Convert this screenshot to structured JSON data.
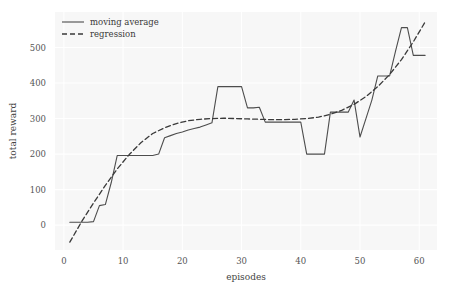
{
  "chart_data": {
    "type": "line",
    "title": "",
    "xlabel": "episodes",
    "ylabel": "total reward",
    "xlim": [
      -1.5,
      63
    ],
    "ylim": [
      -70,
      600
    ],
    "xticks": [
      0,
      10,
      20,
      30,
      40,
      50,
      60
    ],
    "xtick_labels": [
      "0",
      "10",
      "20",
      "30",
      "40",
      "50",
      "60"
    ],
    "yticks": [
      0,
      100,
      200,
      300,
      400,
      500
    ],
    "ytick_labels": [
      "0",
      "100",
      "200",
      "300",
      "400",
      "500"
    ],
    "grid": true,
    "grid_color": "#ffffff",
    "plot_bg": "#f7f7f7",
    "fig_bg": "#ffffff",
    "legend_position": "upper left",
    "series": [
      {
        "name": "moving average",
        "style": "solid",
        "color": "#4d4d4d",
        "linewidth": 1.1,
        "x": [
          1,
          2,
          3,
          4,
          5,
          6,
          7,
          8,
          9,
          10,
          11,
          12,
          13,
          14,
          15,
          16,
          17,
          18,
          19,
          20,
          21,
          22,
          23,
          24,
          25,
          26,
          27,
          28,
          29,
          30,
          31,
          32,
          33,
          34,
          35,
          36,
          37,
          38,
          39,
          40,
          41,
          42,
          43,
          44,
          45,
          46,
          47,
          48,
          49,
          50,
          51,
          52,
          53,
          54,
          55,
          56,
          57,
          58,
          59,
          60,
          61
        ],
        "values": [
          8,
          8,
          8,
          8,
          10,
          55,
          58,
          120,
          196,
          196,
          196,
          196,
          196,
          196,
          196,
          200,
          246,
          252,
          258,
          262,
          268,
          272,
          276,
          282,
          288,
          390,
          390,
          390,
          390,
          390,
          330,
          330,
          332,
          290,
          290,
          290,
          290,
          290,
          290,
          290,
          200,
          200,
          200,
          200,
          318,
          318,
          318,
          318,
          352,
          248,
          300,
          352,
          420,
          420,
          420,
          490,
          556,
          556,
          478,
          478,
          478
        ]
      },
      {
        "name": "regression",
        "style": "dashed",
        "color": "#3a3a3a",
        "linewidth": 1.3,
        "x": [
          1,
          3,
          5,
          7,
          9,
          11,
          13,
          15,
          17,
          19,
          21,
          23,
          25,
          27,
          29,
          31,
          33,
          35,
          37,
          39,
          41,
          43,
          45,
          47,
          49,
          51,
          53,
          55,
          57,
          59,
          61
        ],
        "values": [
          -48,
          10,
          62,
          112,
          158,
          198,
          232,
          258,
          274,
          286,
          294,
          298,
          300,
          301,
          300,
          299,
          298,
          297,
          297,
          298,
          300,
          304,
          312,
          324,
          340,
          362,
          390,
          424,
          466,
          516,
          572
        ]
      }
    ]
  },
  "legend": {
    "entries": [
      {
        "label": "moving average",
        "style": "solid"
      },
      {
        "label": "regression",
        "style": "dashed"
      }
    ]
  }
}
